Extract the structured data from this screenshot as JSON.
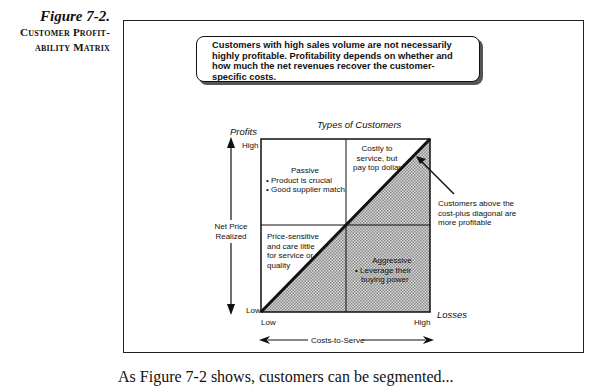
{
  "figure": {
    "number": "Figure 7-2.",
    "title_line1": "Customer Profit-",
    "title_line2": "ability Matrix"
  },
  "callout": {
    "text": "Customers with high sales volume are not necessarily highly profitable.  Profitability depends on whether and how much the net revenues recover the customer-specific costs."
  },
  "matrix": {
    "title": "Types of Customers",
    "y_axis": {
      "top_label": "Profits",
      "label_line1": "Net Price",
      "label_line2": "Realized",
      "high": "High",
      "low": "Low"
    },
    "x_axis": {
      "label": "Costs-to-Serve",
      "low": "Low",
      "high": "High",
      "right_label": "Losses"
    },
    "quadrants": {
      "top_left": {
        "title": "Passive",
        "bullets": [
          "• Product is crucial",
          "• Good supplier match"
        ]
      },
      "top_right": {
        "line1": "Costly to",
        "line2": "service, but",
        "line3": "pay top dollar"
      },
      "bottom_left": {
        "line1": "Price-sensitive",
        "line2": "and care little",
        "line3": "for service or",
        "line4": "quality"
      },
      "bottom_right": {
        "title": "Aggressive",
        "bullet_line1": "• Leverage their",
        "bullet_line2": "buying power"
      }
    },
    "annotation": {
      "line1": "Customers above the",
      "line2": "cost-plus diagonal are",
      "line3": "more profitable"
    }
  },
  "body_text": "As Figure 7-2 shows, customers can be segmented..."
}
